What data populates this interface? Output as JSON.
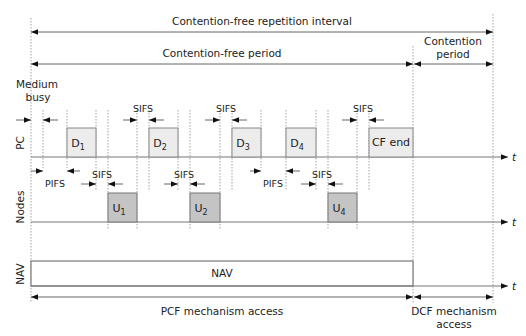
{
  "diagram": {
    "title_top": "Contention-free repetition interval",
    "cfp_label": "Contention-free period",
    "cp_label_line1": "Contention",
    "cp_label_line2": "period",
    "medium_busy_line1": "Medium",
    "medium_busy_line2": "busy",
    "rows": {
      "pc": "PC",
      "nodes": "Nodes",
      "nav": "NAV"
    },
    "time_axis_label": "t",
    "pc_frames": [
      {
        "base": "D",
        "sub": "1"
      },
      {
        "base": "D",
        "sub": "2"
      },
      {
        "base": "D",
        "sub": "3"
      },
      {
        "base": "D",
        "sub": "4"
      },
      {
        "base": "CF end",
        "sub": ""
      }
    ],
    "node_frames": [
      {
        "base": "U",
        "sub": "1"
      },
      {
        "base": "U",
        "sub": "2"
      },
      {
        "base": "U",
        "sub": "4"
      }
    ],
    "gaps": {
      "sifs": "SIFS",
      "pifs": "PIFS"
    },
    "nav_label": "NAV",
    "bottom_left": "PCF mechanism access",
    "bottom_right_line1": "DCF mechanism",
    "bottom_right_line2": "access",
    "colors": {
      "pc_frame_fill": "#ececec",
      "node_frame_fill": "#c4c4c4",
      "line": "#777777",
      "text": "#222222"
    }
  }
}
